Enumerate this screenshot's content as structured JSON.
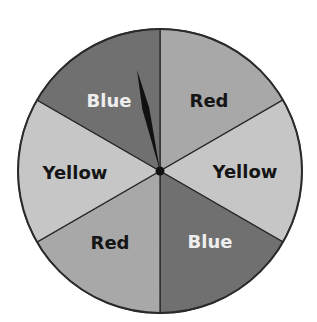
{
  "spinner": {
    "center": [
      160,
      171
    ],
    "radius": 142,
    "border_color": "#2a2a2a",
    "sectors": [
      {
        "label": "Red",
        "color": "#a8a8a8",
        "text_color": "#151515",
        "start": -90,
        "end": -30,
        "lx": 209,
        "ly": 107
      },
      {
        "label": "Yellow",
        "color": "#c6c6c6",
        "text_color": "#151515",
        "start": -30,
        "end": 30,
        "lx": 245,
        "ly": 178
      },
      {
        "label": "Blue",
        "color": "#707070",
        "text_color": "#eeeeee",
        "start": 30,
        "end": 90,
        "lx": 210,
        "ly": 248
      },
      {
        "label": "Red",
        "color": "#a8a8a8",
        "text_color": "#151515",
        "start": 90,
        "end": 150,
        "lx": 110,
        "ly": 249
      },
      {
        "label": "Yellow",
        "color": "#c6c6c6",
        "text_color": "#151515",
        "start": 150,
        "end": 210,
        "lx": 75,
        "ly": 179
      },
      {
        "label": "Blue",
        "color": "#707070",
        "text_color": "#eeeeee",
        "start": 210,
        "end": 270,
        "lx": 109,
        "ly": 107
      }
    ],
    "pointer": {
      "color": "#111111",
      "tip": [
        137,
        70
      ],
      "pointing_to": "Blue"
    }
  }
}
